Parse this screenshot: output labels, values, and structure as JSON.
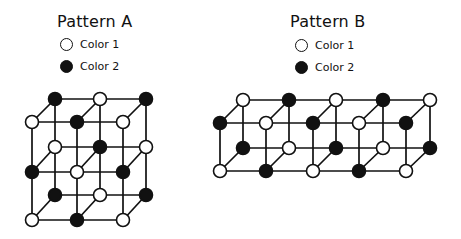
{
  "colors": {
    "color1": "#ffffff",
    "color2": "#111111",
    "stroke": "#111111"
  },
  "panels": [
    {
      "id": "pattern-a",
      "title": "Pattern A",
      "title_pos": [
        57,
        12
      ],
      "legend": [
        {
          "label": "Color 1",
          "color": "color1",
          "pos": [
            60,
            38
          ]
        },
        {
          "label": "Color 2",
          "color": "color2",
          "pos": [
            60,
            60
          ]
        }
      ],
      "lattice": {
        "front_x": [
          32,
          77,
          123
        ],
        "back_x": [
          55,
          100,
          146
        ],
        "layers": [
          {
            "back_y": 99,
            "front_y": 122,
            "back": [
              "color2",
              "color1",
              "color2"
            ],
            "front": [
              "color1",
              "color2",
              "color1"
            ]
          },
          {
            "back_y": 147,
            "front_y": 172,
            "back": [
              "color1",
              "color2",
              "color1"
            ],
            "front": [
              "color2",
              "color1",
              "color2"
            ]
          },
          {
            "back_y": 195,
            "front_y": 220,
            "back": [
              "color2",
              "color1",
              "color2"
            ],
            "front": [
              "color1",
              "color2",
              "color1"
            ]
          }
        ]
      }
    },
    {
      "id": "pattern-b",
      "title": "Pattern B",
      "title_pos": [
        290,
        12
      ],
      "legend": [
        {
          "label": "Color 1",
          "color": "color1",
          "pos": [
            295,
            39
          ]
        },
        {
          "label": "Color 2",
          "color": "color2",
          "pos": [
            295,
            61
          ]
        }
      ],
      "lattice": {
        "front_x": [
          220,
          266,
          313,
          359,
          406
        ],
        "back_x": [
          243,
          289,
          336,
          383,
          430
        ],
        "layers": [
          {
            "back_y": 100,
            "front_y": 123,
            "back": [
              "color1",
              "color2",
              "color1",
              "color2",
              "color1"
            ],
            "front": [
              "color2",
              "color1",
              "color2",
              "color1",
              "color2"
            ]
          },
          {
            "back_y": 148,
            "front_y": 171,
            "back": [
              "color2",
              "color1",
              "color2",
              "color1",
              "color2"
            ],
            "front": [
              "color1",
              "color2",
              "color1",
              "color2",
              "color1"
            ]
          }
        ]
      }
    }
  ]
}
